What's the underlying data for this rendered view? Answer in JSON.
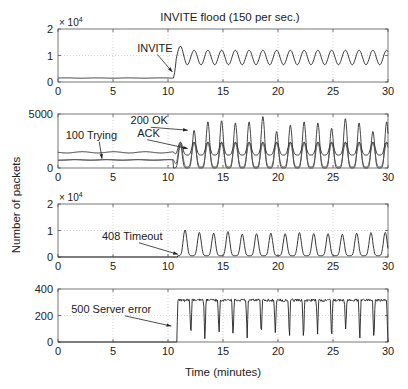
{
  "figure": {
    "title": "INVITE flood (150 per sec.)",
    "shared_ylabel": "Number of packets",
    "shared_xlabel": "Time (minutes)"
  },
  "chart_data": [
    {
      "type": "line",
      "title": "INVITE flood (150 per sec.)",
      "xlabel": "",
      "ylabel": "Number of packets",
      "xlim": [
        0,
        30
      ],
      "ylim": [
        0,
        20000
      ],
      "xticks": [
        0,
        5,
        10,
        15,
        20,
        25,
        30
      ],
      "yticks": [
        0,
        1,
        2
      ],
      "ytick_labels": [
        "0",
        "1",
        "2"
      ],
      "y_multiplier": "× 10^4",
      "grid": true,
      "annotations": [
        {
          "text": "INVITE",
          "x_text": 7.2,
          "y_text": 11500,
          "x_arrow": 10.4,
          "y_arrow": 3800
        }
      ],
      "series": [
        {
          "name": "INVITE",
          "baseline": 1500,
          "onset": 10.5,
          "first_peak": {
            "x": 11.0,
            "y": 13500
          },
          "period_min": 1.25,
          "low": 6500,
          "high": 12000
        }
      ]
    },
    {
      "type": "line",
      "xlim": [
        0,
        30
      ],
      "ylim": [
        0,
        5000
      ],
      "xticks": [
        0,
        5,
        10,
        15,
        20,
        25,
        30
      ],
      "yticks": [
        0,
        5000
      ],
      "ytick_labels": [
        "0",
        "5000"
      ],
      "grid": true,
      "annotations": [
        {
          "text": "100 Trying",
          "x_text": 0.7,
          "y_text": 2700,
          "x_arrow": 4.0,
          "y_arrow": 850
        },
        {
          "text": "200 OK",
          "x_text": 6.6,
          "y_text": 4050,
          "x_arrow": 11.8,
          "y_arrow": 3500
        },
        {
          "text": "ACK",
          "x_text": 7.2,
          "y_text": 2900,
          "x_arrow": 11.8,
          "y_arrow": 1800
        }
      ],
      "series": [
        {
          "name": "100 Trying",
          "baseline": 1450,
          "onset": 10.5,
          "period_min": 1.25,
          "low": 1200,
          "high": 2400
        },
        {
          "name": "200 OK",
          "baseline": 750,
          "onset": 10.5,
          "period_min": 1.25,
          "low": 0,
          "peaks": [
            2200,
            3500,
            4300,
            4400,
            4200,
            4300,
            4800,
            3400,
            4000,
            4300,
            4200,
            3700,
            4600,
            4200,
            3400,
            4300,
            4800
          ]
        },
        {
          "name": "ACK",
          "baseline": 750,
          "onset": 10.5,
          "period_min": 1.25,
          "low": 100,
          "high": 2300
        }
      ]
    },
    {
      "type": "line",
      "xlim": [
        0,
        30
      ],
      "ylim": [
        0,
        20000
      ],
      "xticks": [
        0,
        5,
        10,
        15,
        20,
        25,
        30
      ],
      "yticks": [
        0,
        1,
        2
      ],
      "ytick_labels": [
        "0",
        "1",
        "2"
      ],
      "y_multiplier": "× 10^4",
      "grid": true,
      "annotations": [
        {
          "text": "408 Timeout",
          "x_text": 4.0,
          "y_text": 6500,
          "x_arrow": 10.9,
          "y_arrow": 1000
        }
      ],
      "series": [
        {
          "name": "408 Timeout",
          "baseline": 0,
          "onset": 10.9,
          "period_min": 1.3,
          "low": 500,
          "peaks": [
            10200,
            9300,
            9000,
            9600,
            8600,
            8800,
            9000,
            8800,
            9200,
            8800,
            8800,
            8600,
            9000,
            9200,
            9300
          ]
        }
      ]
    },
    {
      "type": "line",
      "xlabel": "Time (minutes)",
      "xlim": [
        0,
        30
      ],
      "ylim": [
        0,
        400
      ],
      "xticks": [
        0,
        5,
        10,
        15,
        20,
        25,
        30
      ],
      "yticks": [
        0,
        200,
        400
      ],
      "ytick_labels": [
        "0",
        "200",
        "400"
      ],
      "grid": true,
      "annotations": [
        {
          "text": "500 Server error",
          "x_text": 1.2,
          "y_text": 220,
          "x_arrow": 10.3,
          "y_arrow": 120
        }
      ],
      "series": [
        {
          "name": "500 Server error",
          "baseline": 0,
          "onset": 10.8,
          "period_min": 1.28,
          "plateau": 315,
          "dips": [
            0,
            30,
            0,
            50,
            20,
            30,
            40,
            50,
            20,
            0,
            60,
            0,
            80,
            0,
            0
          ]
        }
      ]
    }
  ]
}
